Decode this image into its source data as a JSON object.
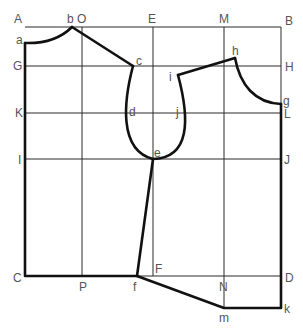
{
  "diagram": {
    "type": "pattern-draft",
    "labels": {
      "A": "A",
      "B": "B",
      "C": "C",
      "D": "D",
      "E": "E",
      "F": "F",
      "G": "G",
      "H": "H",
      "I": "I",
      "J": "J",
      "K": "K",
      "L": "L",
      "M": "M",
      "N": "N",
      "O": "O",
      "P": "P",
      "a": "a",
      "b": "b",
      "c": "c",
      "d": "d",
      "e": "e",
      "f": "f",
      "g": "g",
      "h": "h",
      "i": "i",
      "j": "j",
      "k": "k",
      "m": "m"
    },
    "colors": {
      "line": "#111111",
      "label": "#555555",
      "background": "#ffffff"
    }
  }
}
